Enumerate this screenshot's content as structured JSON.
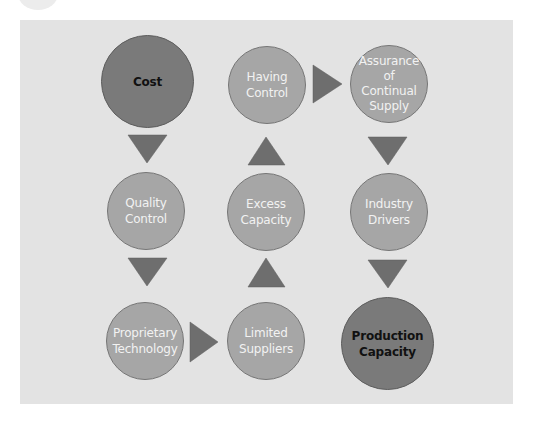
{
  "diagram": {
    "type": "process-flow",
    "nodes": [
      {
        "id": "cost",
        "label": "Cost",
        "emphasis": "dark"
      },
      {
        "id": "having-control",
        "label": "Having\nControl",
        "emphasis": "light"
      },
      {
        "id": "assurance",
        "label": "Assurance\nof\nContinual\nSupply",
        "emphasis": "light"
      },
      {
        "id": "quality-control",
        "label": "Quality\nControl",
        "emphasis": "light"
      },
      {
        "id": "excess-capacity",
        "label": "Excess\nCapacity",
        "emphasis": "light"
      },
      {
        "id": "industry-drivers",
        "label": "Industry\nDrivers",
        "emphasis": "light"
      },
      {
        "id": "proprietary-technology",
        "label": "Proprietary\nTechnology",
        "emphasis": "light"
      },
      {
        "id": "limited-suppliers",
        "label": "Limited\nSuppliers",
        "emphasis": "light"
      },
      {
        "id": "production-capacity",
        "label": "Production\nCapacity",
        "emphasis": "dark"
      }
    ],
    "edges": [
      {
        "from": "cost",
        "to": "quality-control",
        "direction": "down"
      },
      {
        "from": "quality-control",
        "to": "proprietary-technology",
        "direction": "down"
      },
      {
        "from": "proprietary-technology",
        "to": "limited-suppliers",
        "direction": "right"
      },
      {
        "from": "limited-suppliers",
        "to": "excess-capacity",
        "direction": "up"
      },
      {
        "from": "excess-capacity",
        "to": "having-control",
        "direction": "up"
      },
      {
        "from": "having-control",
        "to": "assurance",
        "direction": "right"
      },
      {
        "from": "assurance",
        "to": "industry-drivers",
        "direction": "down"
      },
      {
        "from": "industry-drivers",
        "to": "production-capacity",
        "direction": "down"
      }
    ],
    "colors": {
      "panel": "#e3e3e3",
      "light_node": "#a6a6a6",
      "dark_node": "#7a7a7a",
      "arrow": "#6e6e6e"
    }
  }
}
